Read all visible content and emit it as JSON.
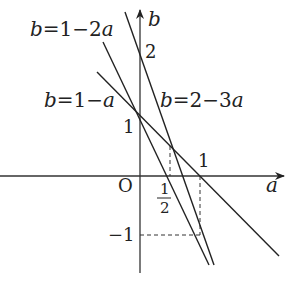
{
  "diagram": {
    "type": "coordinate-plane-lines",
    "axes": {
      "x_label": "a",
      "y_label": "b",
      "origin_label": "O"
    },
    "ticks": {
      "y_1": "1",
      "y_2": "2",
      "y_neg1": "−1",
      "x_1": "1",
      "x_half_num": "1",
      "x_half_den": "2"
    },
    "lines": [
      {
        "name": "b=1-2a",
        "label_b": "b",
        "label_rest": "=1−2",
        "label_a": "a"
      },
      {
        "name": "b=1-a",
        "label_b": "b",
        "label_rest": "=1−",
        "label_a": "a"
      },
      {
        "name": "b=2-3a",
        "label_b": "b",
        "label_rest": "=2−3",
        "label_a": "a"
      }
    ],
    "points": [
      {
        "a": 0,
        "b": 1
      },
      {
        "a": 0.5,
        "b": 0.5
      },
      {
        "a": 1,
        "b": 0
      },
      {
        "a": 1,
        "b": -1
      }
    ],
    "colors": {
      "ink": "#222222",
      "background": "#ffffff"
    }
  }
}
